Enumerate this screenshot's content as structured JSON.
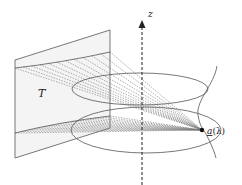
{
  "figure": {
    "plane_label": "T",
    "axis_label": "z",
    "point_label_base": "a",
    "point_label_arg": "(λ)",
    "colors": {
      "line": "#555555",
      "dash": "#777777",
      "plane_fill": "#f4f4f4",
      "axis": "#222222"
    },
    "upper_ray_count": 12,
    "lower_ray_count": 14
  }
}
